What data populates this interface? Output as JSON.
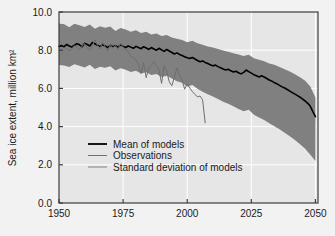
{
  "chart_data": {
    "type": "line",
    "title": "",
    "xlabel": "",
    "ylabel": "Sea ice extent, million km²",
    "xlim": [
      1950,
      2051
    ],
    "ylim": [
      0.0,
      10.0
    ],
    "xticks": [
      1950,
      1975,
      2000,
      2025,
      2050
    ],
    "xtick_labels": [
      "1950",
      "1975",
      "2000",
      "2025",
      "2050"
    ],
    "yticks": [
      0.0,
      2.0,
      4.0,
      6.0,
      8.0,
      10.0
    ],
    "ytick_labels": [
      "0.0",
      "2.0",
      "4.0",
      "6.0",
      "8.0",
      "10.0"
    ],
    "grid": true,
    "grid_color": "#ffffff",
    "plot_background": "#e6e6e6",
    "figure_background": "#f2f2f2",
    "legend_position": "lower-left-inside",
    "legend": [
      {
        "label": "Mean of models",
        "color": "#000000",
        "width": 1.8
      },
      {
        "label": "Observations",
        "color": "#6e6e6e",
        "width": 1.0
      },
      {
        "label": "Standard deviation of models",
        "color": "#808080",
        "width": 1.0
      }
    ],
    "series": [
      {
        "name": "Mean of models",
        "color": "#000000",
        "x": [
          1950,
          1951,
          1952,
          1953,
          1954,
          1955,
          1956,
          1957,
          1958,
          1959,
          1960,
          1961,
          1962,
          1963,
          1964,
          1965,
          1966,
          1967,
          1968,
          1969,
          1970,
          1971,
          1972,
          1973,
          1974,
          1975,
          1976,
          1977,
          1978,
          1979,
          1980,
          1981,
          1982,
          1983,
          1984,
          1985,
          1986,
          1987,
          1988,
          1989,
          1990,
          1991,
          1992,
          1993,
          1994,
          1995,
          1996,
          1997,
          1998,
          1999,
          2000,
          2001,
          2002,
          2003,
          2004,
          2005,
          2006,
          2007,
          2008,
          2009,
          2010,
          2011,
          2012,
          2013,
          2014,
          2015,
          2016,
          2017,
          2018,
          2019,
          2020,
          2021,
          2022,
          2023,
          2024,
          2025,
          2026,
          2027,
          2028,
          2029,
          2030,
          2031,
          2032,
          2033,
          2034,
          2035,
          2036,
          2037,
          2038,
          2039,
          2040,
          2041,
          2042,
          2043,
          2044,
          2045,
          2046,
          2047,
          2048,
          2049,
          2050
        ],
        "values": [
          8.2,
          8.24,
          8.18,
          8.3,
          8.22,
          8.16,
          8.26,
          8.34,
          8.28,
          8.18,
          8.36,
          8.3,
          8.22,
          8.4,
          8.34,
          8.26,
          8.2,
          8.28,
          8.22,
          8.14,
          8.26,
          8.18,
          8.24,
          8.16,
          8.28,
          8.2,
          8.14,
          8.22,
          8.16,
          8.1,
          8.2,
          8.14,
          8.08,
          8.18,
          8.12,
          8.04,
          8.14,
          8.06,
          8.0,
          8.1,
          8.02,
          7.94,
          8.04,
          7.96,
          7.88,
          7.8,
          7.86,
          7.78,
          7.72,
          7.66,
          7.6,
          7.56,
          7.62,
          7.54,
          7.46,
          7.4,
          7.44,
          7.36,
          7.3,
          7.24,
          7.18,
          7.22,
          7.14,
          7.08,
          7.02,
          6.96,
          7.0,
          6.92,
          6.86,
          6.9,
          6.82,
          6.76,
          6.84,
          6.96,
          6.88,
          6.8,
          6.72,
          6.66,
          6.6,
          6.66,
          6.6,
          6.52,
          6.44,
          6.38,
          6.3,
          6.24,
          6.16,
          6.08,
          6.02,
          5.94,
          5.86,
          5.78,
          5.7,
          5.62,
          5.54,
          5.44,
          5.34,
          5.22,
          5.06,
          4.78,
          4.52
        ]
      },
      {
        "name": "Observations",
        "color": "#6e6e6e",
        "x": [
          1953,
          1954,
          1955,
          1956,
          1957,
          1958,
          1959,
          1960,
          1961,
          1962,
          1963,
          1964,
          1965,
          1966,
          1967,
          1968,
          1969,
          1970,
          1971,
          1972,
          1973,
          1974,
          1975,
          1976,
          1977,
          1978,
          1979,
          1980,
          1981,
          1982,
          1983,
          1984,
          1985,
          1986,
          1987,
          1988,
          1989,
          1990,
          1991,
          1992,
          1993,
          1994,
          1995,
          1996,
          1997,
          1998,
          1999,
          2000,
          2001,
          2002,
          2003,
          2004,
          2005,
          2006,
          2007
        ],
        "values": [
          8.1,
          7.96,
          8.06,
          8.24,
          8.14,
          8.02,
          8.22,
          8.34,
          8.12,
          8.0,
          8.2,
          8.54,
          8.26,
          8.06,
          8.42,
          8.18,
          7.96,
          8.3,
          8.12,
          8.24,
          8.04,
          8.36,
          8.16,
          8.02,
          7.92,
          7.7,
          7.6,
          7.48,
          7.26,
          6.78,
          7.36,
          6.56,
          7.1,
          7.2,
          7.4,
          7.18,
          6.98,
          6.26,
          7.2,
          6.9,
          6.34,
          6.14,
          6.6,
          7.08,
          6.68,
          6.44,
          5.96,
          6.24,
          6.02,
          5.84,
          5.68,
          5.56,
          5.6,
          5.4,
          4.2
        ]
      }
    ],
    "band": {
      "name": "Standard deviation of models",
      "fill": "#808080",
      "x": [
        1950,
        1952,
        1954,
        1956,
        1958,
        1960,
        1962,
        1964,
        1966,
        1968,
        1970,
        1972,
        1974,
        1976,
        1978,
        1980,
        1982,
        1984,
        1986,
        1988,
        1990,
        1992,
        1994,
        1996,
        1998,
        2000,
        2002,
        2004,
        2006,
        2008,
        2010,
        2012,
        2014,
        2016,
        2018,
        2020,
        2022,
        2024,
        2026,
        2028,
        2030,
        2032,
        2034,
        2036,
        2038,
        2040,
        2042,
        2044,
        2046,
        2048,
        2050
      ],
      "upper": [
        9.4,
        9.36,
        9.2,
        9.38,
        9.3,
        9.22,
        9.34,
        9.12,
        9.26,
        9.18,
        9.24,
        9.0,
        9.16,
        9.08,
        8.96,
        9.04,
        8.9,
        8.96,
        8.82,
        8.88,
        8.74,
        8.8,
        8.66,
        8.6,
        8.54,
        8.42,
        8.5,
        8.36,
        8.28,
        8.2,
        8.14,
        8.06,
        7.98,
        7.92,
        7.84,
        7.78,
        7.7,
        7.76,
        7.58,
        7.5,
        7.42,
        7.3,
        7.24,
        7.12,
        7.0,
        6.88,
        6.74,
        6.58,
        6.4,
        6.1,
        5.52
      ],
      "lower": [
        7.22,
        7.2,
        7.12,
        7.26,
        7.18,
        7.1,
        7.24,
        7.02,
        7.14,
        7.08,
        7.16,
        6.94,
        7.06,
        6.98,
        6.86,
        6.92,
        6.78,
        6.84,
        6.7,
        6.76,
        6.6,
        6.66,
        6.52,
        6.38,
        6.3,
        6.1,
        6.18,
        5.98,
        5.82,
        5.7,
        5.58,
        5.44,
        5.3,
        5.2,
        5.06,
        4.92,
        4.8,
        4.88,
        4.62,
        4.48,
        4.34,
        4.18,
        4.02,
        3.86,
        3.68,
        3.5,
        3.3,
        3.08,
        2.84,
        2.52,
        2.2
      ]
    }
  },
  "axes": {
    "ylabel": "Sea ice extent, million km²"
  }
}
